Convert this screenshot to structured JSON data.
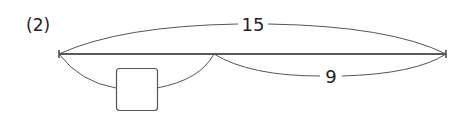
{
  "problem": {
    "number_label": "(2)"
  },
  "diagram": {
    "total_label": "15",
    "part_known_label": "9",
    "part_unknown_label": "",
    "colors": {
      "main_line": "#222222",
      "arcs": "#555555",
      "box_border": "#555555"
    }
  }
}
